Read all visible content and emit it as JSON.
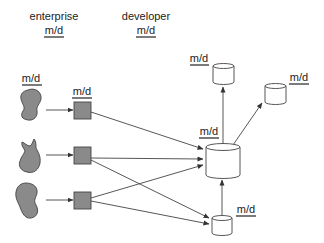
{
  "headers": {
    "enterprise": {
      "title": "enterprise",
      "label": "m/d"
    },
    "developer": {
      "title": "developer",
      "label": "m/d"
    }
  },
  "sources": [
    {
      "shape": "blob",
      "label": "m/d"
    },
    {
      "shape": "blob",
      "label": ""
    },
    {
      "shape": "blob",
      "label": ""
    }
  ],
  "enterprise_nodes": [
    {
      "shape": "square",
      "label": "m/d"
    },
    {
      "shape": "square",
      "label": ""
    },
    {
      "shape": "square",
      "label": ""
    }
  ],
  "developer_nodes": {
    "central": {
      "shape": "cylinder",
      "label": "m/d"
    },
    "top": {
      "shape": "cylinder",
      "label": "m/d"
    },
    "right": {
      "shape": "cylinder",
      "label": "m/d"
    },
    "bottom": {
      "shape": "cylinder",
      "label": "m/d"
    }
  },
  "colors": {
    "fill_gray": "#8a8a8a",
    "stroke": "#444444",
    "cylinder_fill": "#ffffff",
    "text": "#222222"
  }
}
